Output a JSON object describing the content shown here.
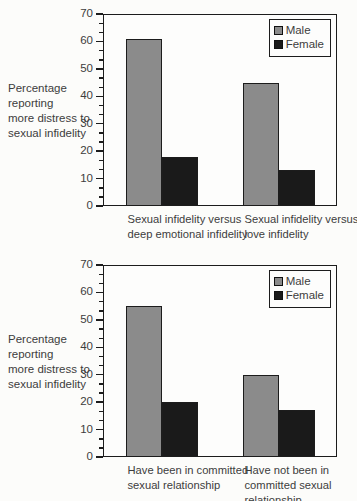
{
  "colors": {
    "male": "#8b8b8b",
    "female": "#1a1a1a",
    "axis": "#1c1c1c",
    "text": "#3d3d3d",
    "background": "#fcfcfa"
  },
  "chart_data": [
    {
      "type": "bar",
      "title": "",
      "ylabel": "Percentage reporting more distress to sexual infidelity",
      "ylabel_lines": [
        "Percentage",
        "reporting",
        "more distress to",
        "sexual infidelity"
      ],
      "ylim": [
        0,
        70
      ],
      "ytick_interval": 10,
      "minor_ticks_between": 2,
      "grid": false,
      "legend_position": "top-right",
      "categories": [
        "Sexual infidelity versus deep emotional infidelity",
        "Sexual infidelity versus love infidelity"
      ],
      "category_lines": [
        [
          "Sexual infidelity versus",
          "deep emotional infidelity"
        ],
        [
          "Sexual infidelity versus",
          "love infidelity"
        ]
      ],
      "series": [
        {
          "name": "Male",
          "values": [
            61,
            45
          ]
        },
        {
          "name": "Female",
          "values": [
            18,
            13
          ]
        }
      ]
    },
    {
      "type": "bar",
      "title": "",
      "ylabel": "Percentage reporting more distress to sexual infidelity",
      "ylabel_lines": [
        "Percentage",
        "reporting",
        "more distress to",
        "sexual infidelity"
      ],
      "ylim": [
        0,
        70
      ],
      "ytick_interval": 10,
      "minor_ticks_between": 2,
      "grid": false,
      "legend_position": "top-right",
      "categories": [
        "Have been in committed sexual relationship",
        "Have not been in committed sexual relationship"
      ],
      "category_lines": [
        [
          "Have been in committed",
          "sexual relationship"
        ],
        [
          "Have not been in",
          "committed sexual",
          "relationship"
        ]
      ],
      "series": [
        {
          "name": "Male",
          "values": [
            55,
            30
          ]
        },
        {
          "name": "Female",
          "values": [
            20,
            17
          ]
        }
      ]
    }
  ]
}
